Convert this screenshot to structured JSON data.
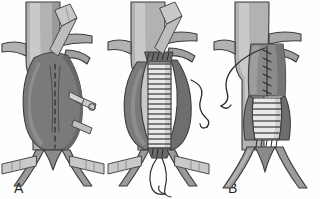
{
  "figure": {
    "background_color": "#fefefe",
    "panel_count": 3
  },
  "labels": {
    "a": "A",
    "b": "B",
    "c": "C",
    "color": "#2b2b2b"
  },
  "palette": {
    "vessel_light": "#b2b2b2",
    "vessel_mid": "#9a9a9a",
    "vessel_dark": "#707070",
    "sac_fill": "#7a7a7a",
    "sac_shadow": "#686868",
    "graft_fill": "#e8e8e8",
    "graft_rib": "#5a5a5a",
    "instrument_fill": "#c9c9c9",
    "instrument_edge": "#4a4a4a",
    "suture": "#3a3a3a",
    "outline": "#3d3d3d",
    "highlight": "#d4d4d4"
  },
  "panels": [
    {
      "id": "a",
      "label": "A",
      "caption": "Aneurysm sac opened longitudinally; aorta and iliac arteries clamped",
      "elements": [
        "aorta",
        "lumbar-branches",
        "aneurysm-sac",
        "incision-line",
        "scissors",
        "proximal-clamp",
        "iliac-clamp-left",
        "iliac-clamp-right",
        "iliac-bifurcation"
      ]
    },
    {
      "id": "b",
      "label": "B",
      "caption": "Corrugated tube graft sewn to proximal and distal aortic cuffs with running suture",
      "elements": [
        "aorta",
        "aneurysm-sac-opened",
        "corrugated-graft",
        "proximal-anastomosis",
        "distal-anastomosis",
        "suture-needle",
        "suture-thread-tails",
        "proximal-clamp",
        "iliac-clamp-left",
        "iliac-clamp-right"
      ]
    },
    {
      "id": "c",
      "label": "C",
      "caption": "Aneurysm sac closed over the completed graft; clamps removed",
      "elements": [
        "aorta",
        "graft-in-situ",
        "corrugated-graft-distal",
        "sac-closure-suture-line",
        "suture-needle",
        "iliac-bifurcation"
      ]
    }
  ]
}
